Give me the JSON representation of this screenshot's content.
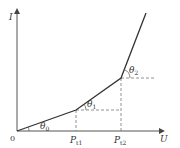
{
  "diagram": {
    "type": "piecewise-linear I-U characteristic",
    "axes": {
      "y_label": "I",
      "x_label": "U",
      "origin_label": "0"
    },
    "points": {
      "origin": {
        "x": 17,
        "y": 131
      },
      "bp1": {
        "x": 76,
        "y": 110
      },
      "bp2": {
        "x": 121,
        "y": 78
      },
      "end": {
        "x": 146,
        "y": 13
      }
    },
    "tick_labels": {
      "p1": {
        "main": "P",
        "sub": "t1"
      },
      "p2": {
        "main": "P",
        "sub": "t2"
      }
    },
    "angle_labels": {
      "theta0": {
        "main": "θ",
        "sub": "0"
      },
      "theta1": {
        "main": "θ",
        "sub": "1"
      },
      "theta2": {
        "main": "θ",
        "sub": "2"
      }
    },
    "colors": {
      "line": "#333333",
      "axis": "#555555",
      "dash": "#777777"
    }
  }
}
